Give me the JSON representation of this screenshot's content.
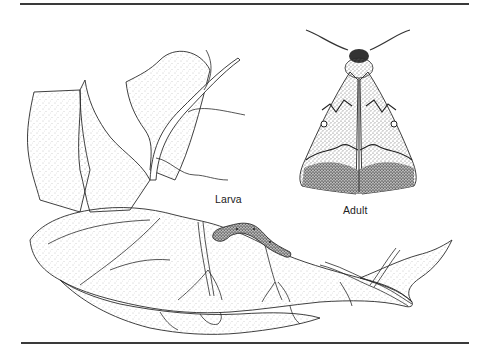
{
  "figure": {
    "labels": {
      "larva": "Larva",
      "adult": "Adult"
    },
    "colors": {
      "ink": "#2a2a2a",
      "stipple": "#8a8a8a",
      "rule": "#3a3a3a",
      "background": "#ffffff"
    }
  }
}
